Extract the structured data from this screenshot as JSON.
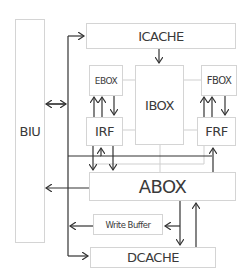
{
  "diagram": {
    "blocks": {
      "biu": "BIU",
      "icache": "ICACHE",
      "ebox": "EBOX",
      "ibox": "IBOX",
      "fbox": "FBOX",
      "irf": "IRF",
      "frf": "FRF",
      "abox": "ABOX",
      "write_buffer": "Write Buffer",
      "dcache": "DCACHE"
    },
    "colors": {
      "arrow": "#333333",
      "link": "#cfcfcf",
      "border": "#d4d4d4"
    }
  }
}
